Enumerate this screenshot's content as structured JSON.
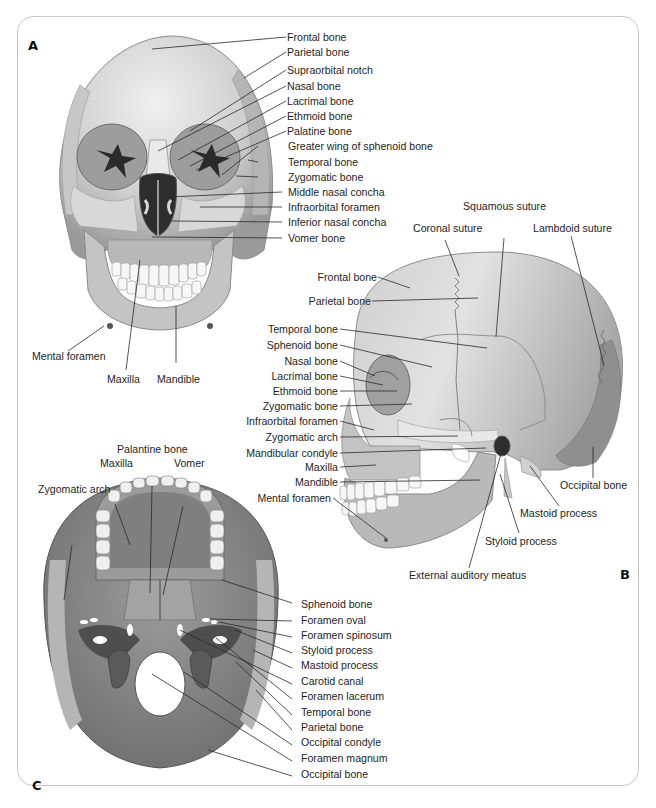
{
  "figure": {
    "panels": {
      "A": {
        "letter": "A",
        "view": "anterior",
        "labels": [
          "Frontal bone",
          "Parietal bone",
          "Supraorbital notch",
          "Nasal bone",
          "Lacrimal  bone",
          "Ethmoid bone",
          "Palatine bone",
          "Greater wing of sphenoid bone",
          "Temporal bone",
          "Zygomatic bone",
          "Middle nasal concha",
          "Infraorbital foramen",
          "Inferior nasal concha",
          "Vomer bone",
          "Mental foramen",
          "Maxilla",
          "Mandible"
        ]
      },
      "B": {
        "letter": "B",
        "view": "lateral",
        "labels": [
          "Squamous suture",
          "Coronal suture",
          "Lambdoid suture",
          "Frontal bone",
          "Parietal bone",
          "Temporal bone",
          "Sphenoid bone",
          "Nasal bone",
          "Lacrimal bone",
          "Ethmoid bone",
          "Zygomatic bone",
          "Infraorbital foramen",
          "Zygomatic arch",
          "Mandibular condyle",
          "Maxilla",
          "Mandible",
          "Mental foramen",
          "Occipital bone",
          "Mastoid process",
          "Styloid process",
          "External auditory meatus"
        ]
      },
      "C": {
        "letter": "C",
        "view": "inferior",
        "labels": [
          "Palantine bone",
          "Maxilla",
          "Vomer",
          "Zygomatic arch",
          "Sphenoid bone",
          "Foramen oval",
          "Foramen spinosum",
          "Styloid process",
          "Mastoid process",
          "Carotid canal",
          "Foramen lacerum",
          "Temporal bone",
          "Parietal bone",
          "Occipital condyle",
          "Foramen magnum",
          "Occipital bone"
        ]
      }
    },
    "colors": {
      "border": "#c8c8c8",
      "bone_light": "#e4e4e4",
      "bone_mid": "#bdbdbd",
      "bone_dark": "#8a8a8a",
      "occipital_dark": "#6e6e6e",
      "leader_line": "#2a2a2a"
    }
  }
}
